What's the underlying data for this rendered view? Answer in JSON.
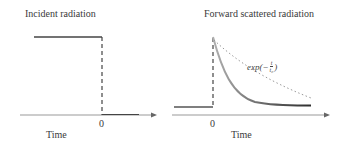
{
  "left_panel": {
    "title": "Incident radiation",
    "zero_label": "0",
    "x_label": "Time"
  },
  "right_panel": {
    "title": "Forward scattered radiation",
    "zero_label": "0",
    "x_label": "Time",
    "equation": {
      "prefix": "exp(",
      "minus": "−",
      "numerator": "t",
      "denominator": "t₀",
      "suffix": ")"
    }
  },
  "colors": {
    "line": "#444444",
    "axis": "#888888",
    "curve_start": "#aaaaaa",
    "curve_end": "#333333",
    "dotted": "#999999"
  }
}
